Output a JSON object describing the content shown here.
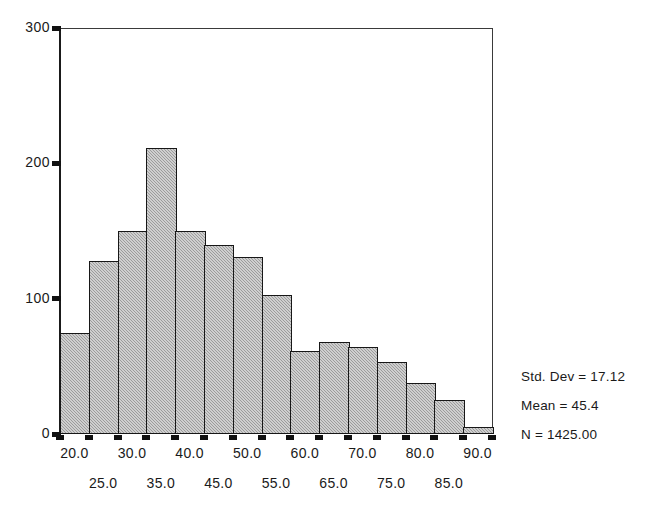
{
  "chart_data": {
    "type": "bar",
    "title": "",
    "subtitle": "",
    "xlabel": "",
    "ylabel": "",
    "xlim": [
      17.5,
      92.5
    ],
    "ylim": [
      0,
      300
    ],
    "grid": false,
    "legend_position": "right",
    "bin_width": 5,
    "categories": [
      "17.5-22.5",
      "22.5-27.5",
      "27.5-32.5",
      "32.5-37.5",
      "37.5-42.5",
      "42.5-47.5",
      "47.5-52.5",
      "52.5-57.5",
      "57.5-62.5",
      "62.5-67.5",
      "67.5-72.5",
      "72.5-77.5",
      "77.5-82.5",
      "82.5-87.5",
      "87.5-92.5"
    ],
    "bin_centers": [
      20.0,
      25.0,
      30.0,
      35.0,
      40.0,
      45.0,
      50.0,
      55.0,
      60.0,
      65.0,
      70.0,
      75.0,
      80.0,
      85.0,
      90.0
    ],
    "values": [
      75,
      128,
      150,
      211,
      150,
      140,
      131,
      103,
      61,
      68,
      64,
      53,
      38,
      25,
      5
    ],
    "y_ticks": [
      0,
      100,
      200,
      300
    ],
    "y_tick_labels": [
      "0",
      "100",
      "200",
      "300"
    ],
    "x_tick_values": [
      20.0,
      25.0,
      30.0,
      35.0,
      40.0,
      45.0,
      50.0,
      55.0,
      60.0,
      65.0,
      70.0,
      75.0,
      80.0,
      85.0,
      90.0
    ],
    "x_tick_labels_row1": [
      "20.0",
      "30.0",
      "40.0",
      "50.0",
      "60.0",
      "70.0",
      "80.0",
      "90.0"
    ],
    "x_tick_labels_row2": [
      "25.0",
      "35.0",
      "45.0",
      "55.0",
      "65.0",
      "75.0",
      "85.0"
    ],
    "annotations": {
      "std_dev": "Std. Dev = 17.12",
      "mean": "Mean = 45.4",
      "n": "N = 1425.00"
    },
    "colors": {
      "bar_fill": "#a9a9a9",
      "bar_edge": "#171717",
      "axis": "#1a1a1a",
      "background": "#ffffff"
    }
  },
  "y_axis": {
    "labels": [
      "300",
      "200",
      "100",
      "0"
    ]
  },
  "x_axis": {
    "row1": [
      "20.0",
      "30.0",
      "40.0",
      "50.0",
      "60.0",
      "70.0",
      "80.0",
      "90.0"
    ],
    "row2": [
      "25.0",
      "35.0",
      "45.0",
      "55.0",
      "65.0",
      "75.0",
      "85.0"
    ]
  },
  "stats_box": {
    "lines": [
      "Std. Dev = 17.12",
      "Mean = 45.4",
      "N = 1425.00"
    ]
  },
  "footer": {
    "caption": ""
  }
}
